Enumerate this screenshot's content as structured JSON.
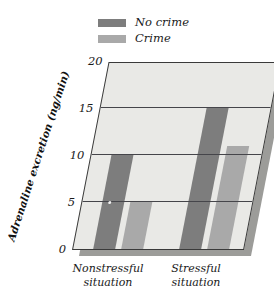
{
  "chart_data": {
    "type": "bar",
    "title": "",
    "xlabel": "",
    "ylabel": "Adrenaline excretion (ng/min)",
    "categories": [
      "Nonstressful situation",
      "Stressful situation"
    ],
    "series": [
      {
        "name": "No crime",
        "values": [
          10,
          15
        ],
        "color": "#7d7d7d"
      },
      {
        "name": "Crime",
        "values": [
          5,
          11
        ],
        "color": "#a9a9a9"
      }
    ],
    "ylim": [
      0,
      20
    ],
    "yticks": [
      0,
      5,
      10,
      15,
      20
    ],
    "ytick_labels": [
      "0",
      "5",
      "10",
      "15",
      "20"
    ],
    "grid": true,
    "legend_position": "top",
    "style": "3d-skewed-parallelogram"
  },
  "legend": {
    "items": [
      {
        "label": "No crime",
        "swatch_name": "legend-swatch-no-crime"
      },
      {
        "label": "Crime",
        "swatch_name": "legend-swatch-crime"
      }
    ]
  },
  "axis": {
    "y_title": "Adrenaline excretion (ng/min)",
    "ticks": [
      "20",
      "15",
      "10",
      "5",
      "0"
    ]
  },
  "categories": [
    {
      "line1": "Nonstressful",
      "line2": "situation"
    },
    {
      "line1": "Stressful",
      "line2": "situation"
    }
  ],
  "colors": {
    "no_crime": "#7d7d7d",
    "crime": "#a9a9a9",
    "plot_background": "#e9e9e6",
    "shadow": "#9c9c99",
    "axis": "#3a3a3a",
    "gridline": "#45454a",
    "text": "#1a1a1a"
  }
}
